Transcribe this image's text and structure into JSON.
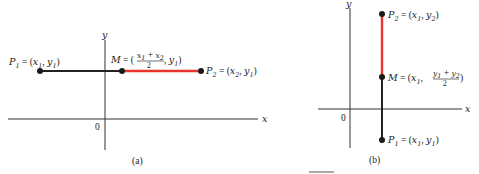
{
  "colors": {
    "background": "#ffffff",
    "axis": "#333333",
    "segment": "#222222",
    "half_segment_highlight": "#e8342c",
    "point": "#1a1a1a"
  },
  "diagram_a": {
    "caption": "(a)",
    "axis_x_label": "x",
    "axis_y_label": "y",
    "origin_label": "0",
    "p1": {
      "name": "P",
      "index": "1",
      "eq": " = (",
      "coord1": "x",
      "coord1_sub": "1",
      "sep": ", ",
      "coord2": "y",
      "coord2_sub": "1",
      "close": ")"
    },
    "m": {
      "name": "M",
      "eq": " = (",
      "num_a": "x",
      "num_a_sub": "1",
      "plus": " + ",
      "num_b": "x",
      "num_b_sub": "2",
      "den": "2",
      "sep": ", ",
      "coord2": "y",
      "coord2_sub": "1",
      "close": ")"
    },
    "p2": {
      "name": "P",
      "index": "2",
      "eq": " = (",
      "coord1": "x",
      "coord1_sub": "2",
      "sep": ", ",
      "coord2": "y",
      "coord2_sub": "1",
      "close": ")"
    }
  },
  "diagram_b": {
    "caption": "(b)",
    "axis_x_label": "x",
    "axis_y_label": "y",
    "origin_label": "0",
    "p2": {
      "name": "P",
      "index": "2",
      "eq": " = (",
      "coord1": "x",
      "coord1_sub": "1",
      "sep": ", ",
      "coord2": "y",
      "coord2_sub": "2",
      "close": ")"
    },
    "m": {
      "name": "M",
      "eq": " = (",
      "coord1": "x",
      "coord1_sub": "1",
      "sep": ", ",
      "num_a": "y",
      "num_a_sub": "1",
      "plus": " + ",
      "num_b": "y",
      "num_b_sub": "2",
      "den": "2",
      "close": ")"
    },
    "p1": {
      "name": "P",
      "index": "1",
      "eq": " = (",
      "coord1": "x",
      "coord1_sub": "1",
      "sep": ", ",
      "coord2": "y",
      "coord2_sub": "1",
      "close": ")"
    }
  }
}
